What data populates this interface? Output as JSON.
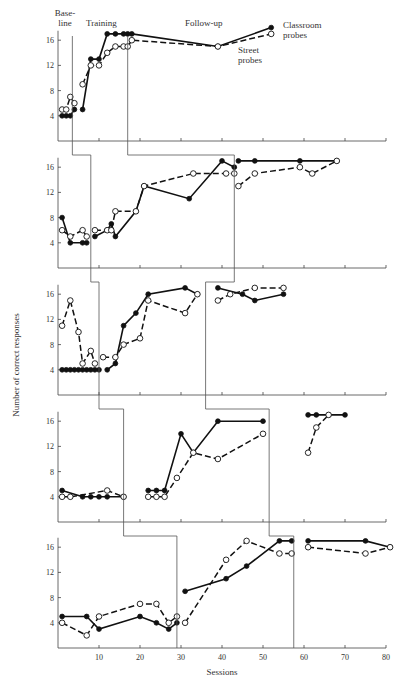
{
  "chart_data": {
    "type": "line",
    "title": "",
    "xlabel": "Sessions",
    "ylabel": "Number of correct responses",
    "xlim": [
      0,
      80
    ],
    "ylim": [
      0,
      17
    ],
    "x_ticks": [
      10,
      20,
      30,
      40,
      50,
      60,
      70,
      80
    ],
    "y_ticks": [
      4,
      8,
      12,
      16
    ],
    "grid": false,
    "legend": {
      "position": "annotation top-right of first panel",
      "entries": [
        "Classroom probes",
        "Street probes"
      ]
    },
    "phase_labels": [
      "Base-\nline",
      "Training",
      "Follow-up"
    ],
    "series_styles": {
      "Classroom probes": {
        "line": "solid",
        "marker": "filled circle"
      },
      "Street probes": {
        "line": "dashed",
        "marker": "open circle"
      }
    },
    "panels": [
      {
        "name": "Panel 1",
        "phase_changes": [
          3.5,
          17
        ],
        "series": [
          {
            "name": "Classroom probes",
            "segments": [
              {
                "x": [
                  1,
                  2,
                  3,
                  4
                ],
                "y": [
                  4,
                  4,
                  4,
                  5
                ]
              },
              {
                "x": [
                  6,
                  8,
                  10,
                  12,
                  14,
                  16
                ],
                "y": [
                  5,
                  13,
                  13,
                  17,
                  17,
                  17
                ]
              },
              {
                "x": [
                  17,
                  18,
                  39,
                  52
                ],
                "y": [
                  17,
                  17,
                  15,
                  18
                ]
              }
            ]
          },
          {
            "name": "Street probes",
            "segments": [
              {
                "x": [
                  1,
                  2,
                  3,
                  4
                ],
                "y": [
                  5,
                  5,
                  7,
                  6
                ]
              },
              {
                "x": [
                  6,
                  8,
                  10,
                  12,
                  14,
                  16
                ],
                "y": [
                  9,
                  12,
                  12,
                  14,
                  15,
                  15
                ]
              },
              {
                "x": [
                  17,
                  18,
                  39,
                  52
                ],
                "y": [
                  15,
                  16,
                  15,
                  17
                ]
              }
            ]
          }
        ]
      },
      {
        "name": "Panel 2",
        "phase_changes": [
          8,
          43
        ],
        "series": [
          {
            "name": "Classroom probes",
            "segments": [
              {
                "x": [
                  1,
                  3,
                  6,
                  7
                ],
                "y": [
                  8,
                  4,
                  4,
                  4
                ]
              },
              {
                "x": [
                  9,
                  12,
                  13,
                  14,
                  19,
                  21,
                  32,
                  40,
                  43
                ],
                "y": [
                  5,
                  6,
                  7,
                  5,
                  9,
                  13,
                  11,
                  17,
                  16
                ]
              },
              {
                "x": [
                  44,
                  48,
                  59,
                  68
                ],
                "y": [
                  17,
                  17,
                  17,
                  17
                ]
              }
            ]
          },
          {
            "name": "Street probes",
            "segments": [
              {
                "x": [
                  1,
                  3,
                  6,
                  7
                ],
                "y": [
                  6,
                  5,
                  6,
                  5
                ]
              },
              {
                "x": [
                  9,
                  12,
                  13,
                  14,
                  19,
                  21,
                  33,
                  41,
                  43
                ],
                "y": [
                  6,
                  6,
                  6,
                  9,
                  9,
                  13,
                  15,
                  15,
                  15
                ]
              },
              {
                "x": [
                  44,
                  48,
                  59,
                  62,
                  68
                ],
                "y": [
                  13,
                  15,
                  16,
                  15,
                  17
                ]
              }
            ]
          }
        ]
      },
      {
        "name": "Panel 3",
        "phase_changes": [
          10,
          36
        ],
        "series": [
          {
            "name": "Classroom probes",
            "segments": [
              {
                "x": [
                  1,
                  2,
                  3,
                  4,
                  5,
                  6,
                  7,
                  8,
                  9,
                  10
                ],
                "y": [
                  4,
                  4,
                  4,
                  4,
                  4,
                  4,
                  4,
                  4,
                  4,
                  4
                ]
              },
              {
                "x": [
                  12,
                  14,
                  16,
                  19,
                  22,
                  31,
                  34
                ],
                "y": [
                  4,
                  5,
                  11,
                  13,
                  16,
                  17,
                  16
                ]
              },
              {
                "x": [
                  39,
                  45,
                  48,
                  55
                ],
                "y": [
                  17,
                  16,
                  15,
                  16
                ]
              }
            ]
          },
          {
            "name": "Street probes",
            "segments": [
              {
                "x": [
                  1,
                  3,
                  5,
                  6,
                  8,
                  9
                ],
                "y": [
                  11,
                  15,
                  10,
                  5,
                  7,
                  5
                ]
              },
              {
                "x": [
                  11,
                  14,
                  16,
                  20,
                  22,
                  31,
                  34
                ],
                "y": [
                  6,
                  6,
                  8,
                  9,
                  15,
                  13,
                  16
                ]
              },
              {
                "x": [
                  39,
                  42,
                  48,
                  55
                ],
                "y": [
                  15,
                  16,
                  17,
                  17
                ]
              }
            ]
          }
        ]
      },
      {
        "name": "Panel 4",
        "phase_changes": [
          16,
          51.5
        ],
        "series": [
          {
            "name": "Classroom probes",
            "segments": [
              {
                "x": [
                  1,
                  6,
                  8,
                  10,
                  12,
                  16
                ],
                "y": [
                  5,
                  4,
                  4,
                  4,
                  4,
                  4
                ]
              },
              {
                "x": [
                  22,
                  24,
                  26,
                  30,
                  33,
                  39,
                  50
                ],
                "y": [
                  5,
                  5,
                  5,
                  14,
                  11,
                  16,
                  16
                ]
              },
              {
                "x": [
                  61,
                  63,
                  66,
                  70
                ],
                "y": [
                  17,
                  17,
                  17,
                  17
                ]
              }
            ]
          },
          {
            "name": "Street probes",
            "segments": [
              {
                "x": [
                  1,
                  3,
                  12,
                  16
                ],
                "y": [
                  4,
                  4,
                  5,
                  4
                ]
              },
              {
                "x": [
                  22,
                  24,
                  26,
                  29,
                  33,
                  39,
                  50
                ],
                "y": [
                  4,
                  4,
                  4,
                  7,
                  11,
                  10,
                  14
                ]
              },
              {
                "x": [
                  61,
                  63,
                  66
                ],
                "y": [
                  11,
                  15,
                  17
                ]
              }
            ]
          }
        ]
      },
      {
        "name": "Panel 5",
        "phase_changes": [
          29,
          57.5
        ],
        "series": [
          {
            "name": "Classroom probes",
            "segments": [
              {
                "x": [
                  1,
                  7,
                  10,
                  20,
                  24,
                  27,
                  29
                ],
                "y": [
                  5,
                  5,
                  3,
                  5,
                  4,
                  3,
                  4
                ]
              },
              {
                "x": [
                  31,
                  41,
                  46,
                  54,
                  57
                ],
                "y": [
                  9,
                  11,
                  13,
                  17,
                  17
                ]
              },
              {
                "x": [
                  61,
                  75,
                  81
                ],
                "y": [
                  17,
                  17,
                  16
                ]
              }
            ]
          },
          {
            "name": "Street probes",
            "segments": [
              {
                "x": [
                  1,
                  7,
                  10,
                  20,
                  24,
                  27,
                  29
                ],
                "y": [
                  4,
                  2,
                  5,
                  7,
                  7,
                  4,
                  5
                ]
              },
              {
                "x": [
                  31,
                  41,
                  46,
                  54,
                  57
                ],
                "y": [
                  4,
                  14,
                  17,
                  15,
                  15
                ]
              },
              {
                "x": [
                  61,
                  75,
                  81
                ],
                "y": [
                  16,
                  15,
                  16
                ]
              }
            ]
          }
        ]
      }
    ]
  },
  "labels": {
    "baseline_line1": "Base-",
    "baseline_line2": "line",
    "training": "Training",
    "followup": "Follow-up",
    "classroom_line1": "Classroom",
    "classroom_line2": "probes",
    "street_line1": "Street",
    "street_line2": "probes",
    "xlabel": "Sessions",
    "ylabel": "Number of correct responses"
  }
}
